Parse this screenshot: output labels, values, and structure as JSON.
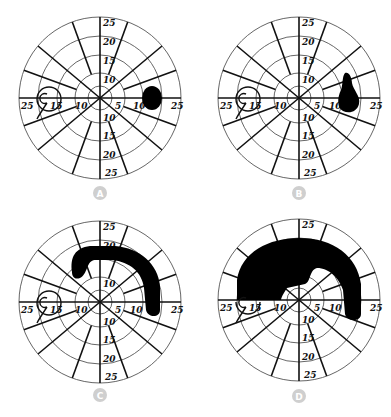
{
  "figure": {
    "panels": [
      {
        "id": "A",
        "label": "A",
        "defect": "small round scotoma temporal to fixation near 10-15 degrees"
      },
      {
        "id": "B",
        "label": "B",
        "defect": "teardrop scotoma extending superiorly from 10-15 degrees"
      },
      {
        "id": "C",
        "label": "C",
        "defect": "arcuate scotoma arching over fixation in superior field"
      },
      {
        "id": "D",
        "label": "D",
        "defect": "dense superior altitudinal/arcuate defect sparing central 5 degrees"
      }
    ],
    "axis_labels": {
      "top": [
        "25",
        "20",
        "15",
        "10"
      ],
      "bottom": [
        "10",
        "15",
        "20",
        "25"
      ],
      "left": [
        "25",
        "15",
        "10"
      ],
      "right": [
        "5",
        "10",
        "25"
      ]
    },
    "blind_spot_label": "15",
    "colors": {
      "defect": "#000000",
      "rings": "#555555",
      "spokes": "#111111",
      "badge": "#cfcfcf",
      "badge_text": "#ffffff"
    }
  }
}
